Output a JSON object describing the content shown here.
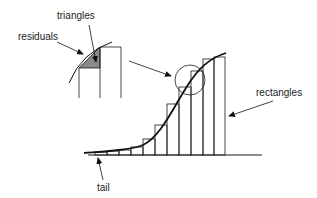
{
  "diagram": {
    "labels": {
      "triangles": "triangles",
      "residuals": "residuals",
      "rectangles": "rectangles",
      "tail": "tail"
    },
    "colors": {
      "stroke": "#1a1a1a",
      "curve": "#111111",
      "shaded_triangle": "#8a8a8a",
      "background": "#ffffff"
    }
  }
}
